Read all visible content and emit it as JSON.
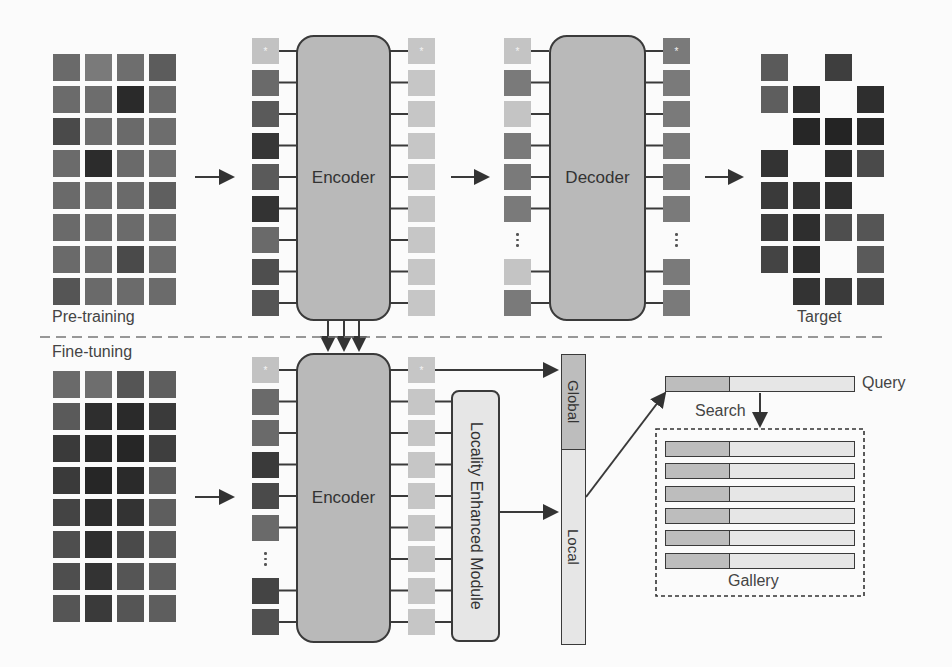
{
  "pretraining": {
    "section_label": "Pre-training",
    "input_grid": {
      "rows": 8,
      "cols": 4,
      "cells": [
        "#6a6a6a",
        "#7a7a7a",
        "#6e6e6e",
        "#5c5c5c",
        "#6b6b6b",
        "#6d6d6d",
        "#2a2a2a",
        "#6a6a6a",
        "#4a4a4a",
        "#6c6c6c",
        "#6a6a6a",
        "#6d6d6d",
        "#6b6b6b",
        "#2c2c2c",
        "#6a6a6a",
        "#6e6e6e",
        "#6a6a6a",
        "#6b6b6b",
        "#6a6a6a",
        "#5f5f5f",
        "#6a6a6a",
        "#6b6b6b",
        "#6b6b6b",
        "#6c6c6c",
        "#6a6a6a",
        "#6b6b6b",
        "#4a4a4a",
        "#6c6c6c",
        "#555555",
        "#6a6a6a",
        "#6b6b6b",
        "#6b6b6b"
      ]
    },
    "encoder_inputs": [
      "#c2c2c2",
      "#6a6a6a",
      "#5a5a5a",
      "#363636",
      "#5a5a5a",
      "#333333",
      "#6a6a6a",
      "#4e4e4e",
      "#555555"
    ],
    "encoder_label": "Encoder",
    "encoder_outputs": [
      "#c6c6c6",
      "#c6c6c6",
      "#c6c6c6",
      "#c6c6c6",
      "#c6c6c6",
      "#c6c6c6",
      "#c6c6c6",
      "#c6c6c6",
      "#c6c6c6"
    ],
    "decoder_inputs": [
      "#c4c4c4",
      "#7a7a7a",
      "#c4c4c4",
      "#7a7a7a",
      "#7a7a7a",
      "#7a7a7a",
      "dots",
      "#c4c4c4",
      "#7a7a7a"
    ],
    "decoder_label": "Decoder",
    "decoder_outputs": [
      "#7a7a7a",
      "#7a7a7a",
      "#7a7a7a",
      "#7a7a7a",
      "#7a7a7a",
      "#7a7a7a",
      "dots",
      "#7a7a7a",
      "#7a7a7a"
    ],
    "target_label": "Target",
    "target_grid": {
      "rows": 8,
      "cols": 4,
      "cells": [
        "#5a5a5a",
        "",
        "#3e3e3e",
        "",
        "#5e5e5e",
        "#2e2e2e",
        "",
        "#2e2e2e",
        "",
        "#262626",
        "#242424",
        "#2a2a2a",
        "#333333",
        "",
        "#2c2c2c",
        "#4a4a4a",
        "#3a3a3a",
        "#333333",
        "#2e2e2e",
        "",
        "#3c3c3c",
        "#2e2e2e",
        "#4e4e4e",
        "#555555",
        "#444444",
        "#2e2e2e",
        "",
        "#5a5a5a",
        "",
        "#333333",
        "#3a3a3a",
        "#444444"
      ]
    },
    "cls_token_mark": "*"
  },
  "finetuning": {
    "section_label": "Fine-tuning",
    "input_grid": {
      "rows": 8,
      "cols": 4,
      "cells": [
        "#6a6a6a",
        "#6e6e6e",
        "#555555",
        "#5e5e5e",
        "#5a5a5a",
        "#2e2e2e",
        "#2a2a2a",
        "#3a3a3a",
        "#3a3a3a",
        "#2a2a2a",
        "#262626",
        "#3e3e3e",
        "#3a3a3a",
        "#262626",
        "#2a2a2a",
        "#5a5a5a",
        "#444444",
        "#2c2c2c",
        "#333333",
        "#5e5e5e",
        "#4e4e4e",
        "#2e2e2e",
        "#4a4a4a",
        "#5a5a5a",
        "#4e4e4e",
        "#333333",
        "#555555",
        "#5e5e5e",
        "#555555",
        "#3a3a3a",
        "#555555",
        "#5e5e5e"
      ]
    },
    "encoder_inputs": [
      "#c2c2c2",
      "#6a6a6a",
      "#6a6a6a",
      "#3a3a3a",
      "#4a4a4a",
      "#6a6a6a",
      "dots",
      "#444444",
      "#505050"
    ],
    "encoder_label": "Encoder",
    "encoder_outputs": [
      "#c6c6c6",
      "#c6c6c6",
      "#c6c6c6",
      "#c6c6c6",
      "#c6c6c6",
      "#c6c6c6",
      "#c6c6c6",
      "#c6c6c6",
      "#c6c6c6"
    ],
    "lem_label": "Locality Enhanced Module",
    "feature_global_label": "Global",
    "feature_local_label": "Local",
    "search_label": "Search",
    "query_label": "Query",
    "gallery_label": "Gallery",
    "gallery_rows": 6
  },
  "colors": {
    "block_fill": "#b9b9b9",
    "outline": "#3a3a3a",
    "light_token": "#c6c6c6",
    "global_fill": "#bdbdbd",
    "local_fill": "#e6e6e6",
    "background": "#fbfbfb"
  }
}
